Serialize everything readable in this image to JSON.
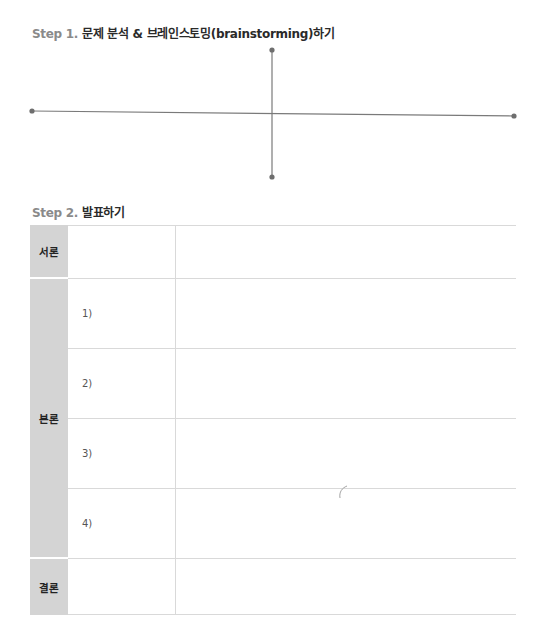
{
  "step1": {
    "number": "Step 1.",
    "title": "문제 분석 & 브레인스토밍(brainstorming)하기"
  },
  "step2": {
    "number": "Step 2.",
    "title": "발표하기"
  },
  "diagram": {
    "type": "cross-axes",
    "line_color": "#7a7a7a",
    "horizontal": {
      "x1": 32,
      "y1": 111,
      "x2": 514,
      "y2": 116
    },
    "vertical": {
      "x1": 272,
      "y1": 50,
      "x2": 272,
      "y2": 177
    }
  },
  "table": {
    "sections": [
      {
        "label": "서론",
        "rows": [
          ""
        ]
      },
      {
        "label": "본론",
        "rows": [
          "1)",
          "2)",
          "3)",
          "4)"
        ]
      },
      {
        "label": "결론",
        "rows": [
          ""
        ]
      }
    ],
    "header_fill": "#d4d4d4",
    "border_color": "#d9d9d9"
  }
}
